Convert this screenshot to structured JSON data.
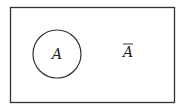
{
  "diagram": {
    "type": "venn",
    "universe": {
      "x": 10,
      "y": 7,
      "width": 164,
      "height": 95,
      "stroke": "#333333"
    },
    "set": {
      "label": "A",
      "cx": 57,
      "cy": 54,
      "r": 24,
      "stroke": "#333333"
    },
    "complement": {
      "label": "A",
      "overline": true,
      "x": 128,
      "y": 56
    }
  }
}
